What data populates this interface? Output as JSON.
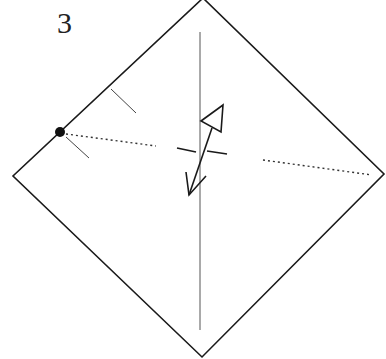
{
  "diagram": {
    "step_number": "3",
    "colors": {
      "line": "#1a1a1a",
      "background": "#ffffff"
    },
    "elements": [
      "square-paper-as-diamond",
      "vertical-center-crease",
      "dotted-horizontal-valley-guide-left",
      "dotted-horizontal-valley-guide-right",
      "reference-point-dot",
      "tick-marks-on-upper-left-edge",
      "crosshair-center-mark",
      "fold-and-unfold-arrow"
    ]
  }
}
